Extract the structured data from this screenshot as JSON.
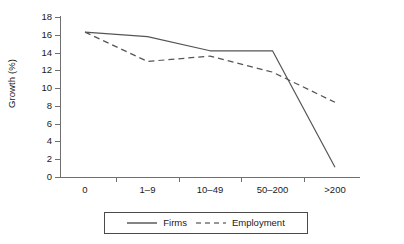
{
  "chart_data": {
    "type": "line",
    "title": "",
    "subtitle": "",
    "xlabel": "",
    "ylabel": "Growth (%)",
    "categories": [
      "0",
      "1–9",
      "10–49",
      "50–200",
      ">200"
    ],
    "ylim": [
      0,
      18
    ],
    "ytick_labels": [
      "0",
      "2",
      "4",
      "6",
      "8",
      "10",
      "12",
      "14",
      "16",
      "18"
    ],
    "ytick_values": [
      0,
      2,
      4,
      6,
      8,
      10,
      12,
      14,
      16,
      18
    ],
    "grid": false,
    "legend_position": "bottom-center",
    "series": [
      {
        "name": "Firms",
        "style": "solid",
        "color": "#555555",
        "values": [
          16.3,
          15.8,
          14.2,
          14.2,
          1.1
        ]
      },
      {
        "name": "Employment",
        "style": "dashed",
        "color": "#555555",
        "values": [
          16.3,
          13.0,
          13.6,
          11.8,
          8.4
        ]
      }
    ]
  },
  "legend": {
    "items": [
      {
        "label": "Firms",
        "style": "solid"
      },
      {
        "label": "Employment",
        "style": "dashed"
      }
    ]
  }
}
